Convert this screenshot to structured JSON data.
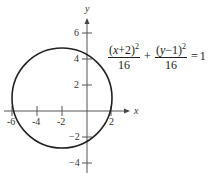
{
  "graph": {
    "x_axis_label": "x",
    "y_axis_label": "y",
    "x_ticks": [
      {
        "value": -6,
        "label": "-6"
      },
      {
        "value": -4,
        "label": "-4"
      },
      {
        "value": -2,
        "label": "-2"
      },
      {
        "value": 2,
        "label": "2"
      }
    ],
    "y_ticks": [
      {
        "value": 6,
        "label": "6"
      },
      {
        "value": 4,
        "label": "4"
      },
      {
        "value": 2,
        "label": "2"
      },
      {
        "value": -2,
        "label": "−2"
      },
      {
        "value": -4,
        "label": "−4"
      }
    ],
    "curve": {
      "type": "circle",
      "center": [
        -2,
        1
      ],
      "radius": 4,
      "color": "#222222"
    }
  },
  "equation": {
    "term1_num_open": "(",
    "term1_var": "x",
    "term1_num_rest": "+2)",
    "term1_exp": "2",
    "term1_den": "16",
    "plus": "+",
    "term2_num_open": "(",
    "term2_var": "y",
    "term2_num_rest": "−1)",
    "term2_exp": "2",
    "term2_den": "16",
    "equals": "=",
    "rhs": "1"
  }
}
